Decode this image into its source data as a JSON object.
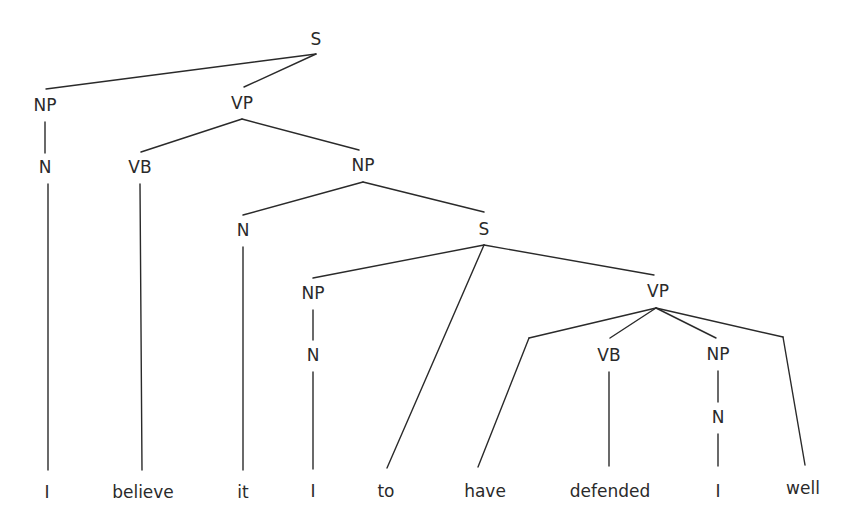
{
  "diagram": {
    "type": "parse-tree",
    "sentence": [
      "I",
      "believe",
      "it",
      "I",
      "to",
      "have",
      "defended",
      "I",
      "well"
    ],
    "nodes": [
      {
        "id": "s1",
        "label": "S",
        "x": 316,
        "y": 40,
        "parent": null
      },
      {
        "id": "np1",
        "label": "NP",
        "x": 45,
        "y": 106,
        "parent": "s1"
      },
      {
        "id": "vp1",
        "label": "VP",
        "x": 242,
        "y": 104,
        "parent": "s1"
      },
      {
        "id": "n1",
        "label": "N",
        "x": 45,
        "y": 168,
        "parent": "np1"
      },
      {
        "id": "vb1",
        "label": "VB",
        "x": 140,
        "y": 168,
        "parent": "vp1"
      },
      {
        "id": "np2",
        "label": "NP",
        "x": 363,
        "y": 166,
        "parent": "vp1"
      },
      {
        "id": "n2",
        "label": "N",
        "x": 243,
        "y": 231,
        "parent": "np2"
      },
      {
        "id": "s2",
        "label": "S",
        "x": 484,
        "y": 230,
        "parent": "np2"
      },
      {
        "id": "np3",
        "label": "NP",
        "x": 313,
        "y": 294,
        "parent": "s2"
      },
      {
        "id": "vp2",
        "label": "VP",
        "x": 658,
        "y": 292,
        "parent": "s2"
      },
      {
        "id": "n3",
        "label": "N",
        "x": 313,
        "y": 356,
        "parent": "np3"
      },
      {
        "id": "vb2",
        "label": "VB",
        "x": 609,
        "y": 356,
        "parent": "vp2"
      },
      {
        "id": "np4",
        "label": "NP",
        "x": 718,
        "y": 355,
        "parent": "vp2"
      },
      {
        "id": "n4",
        "label": "N",
        "x": 718,
        "y": 418,
        "parent": "np4"
      }
    ],
    "leaves": [
      {
        "id": "w1",
        "label": "I",
        "x": 47,
        "y": 493,
        "parent": "n1"
      },
      {
        "id": "w2",
        "label": "believe",
        "x": 143,
        "y": 493,
        "parent": "vb1"
      },
      {
        "id": "w3",
        "label": "it",
        "x": 243,
        "y": 493,
        "parent": "n2"
      },
      {
        "id": "w4",
        "label": "I",
        "x": 313,
        "y": 492,
        "parent": "n3"
      },
      {
        "id": "w5",
        "label": "to",
        "x": 386,
        "y": 492,
        "parent": "s2"
      },
      {
        "id": "w6",
        "label": "have",
        "x": 485,
        "y": 492,
        "parent": "vp2"
      },
      {
        "id": "w7",
        "label": "defended",
        "x": 610,
        "y": 492,
        "parent": "vb2"
      },
      {
        "id": "w8",
        "label": "I",
        "x": 718,
        "y": 492,
        "parent": "n4"
      },
      {
        "id": "w9",
        "label": "well",
        "x": 803,
        "y": 489,
        "parent": "vp2"
      }
    ],
    "edges": [
      {
        "from": "s1",
        "to": "np1",
        "x1": 316,
        "y1": 54,
        "x2": 46,
        "y2": 89
      },
      {
        "from": "s1",
        "to": "vp1",
        "x1": 316,
        "y1": 54,
        "x2": 244,
        "y2": 87
      },
      {
        "from": "vp1",
        "to": "vb1",
        "x1": 242,
        "y1": 119,
        "x2": 141,
        "y2": 152
      },
      {
        "from": "vp1",
        "to": "np2",
        "x1": 242,
        "y1": 119,
        "x2": 359,
        "y2": 150
      },
      {
        "from": "np1",
        "to": "n1",
        "x1": 45,
        "y1": 122,
        "x2": 45,
        "y2": 153
      },
      {
        "from": "np2",
        "to": "n2",
        "x1": 363,
        "y1": 182,
        "x2": 243,
        "y2": 215
      },
      {
        "from": "np2",
        "to": "s2",
        "x1": 363,
        "y1": 182,
        "x2": 484,
        "y2": 212
      },
      {
        "from": "s2",
        "to": "np3",
        "x1": 484,
        "y1": 245,
        "x2": 313,
        "y2": 278
      },
      {
        "from": "s2",
        "to": "vp2",
        "x1": 484,
        "y1": 245,
        "x2": 654,
        "y2": 275
      },
      {
        "from": "s2",
        "to": "w5",
        "x1": 484,
        "y1": 245,
        "x2": 387,
        "y2": 468
      },
      {
        "from": "np3",
        "to": "n3",
        "x1": 313,
        "y1": 310,
        "x2": 313,
        "y2": 340
      },
      {
        "from": "vp2",
        "to": "w6",
        "x1": 656,
        "y1": 308,
        "x2": 529,
        "y2": 338
      },
      {
        "from": "w6a",
        "to": "w6",
        "x1": 529,
        "y1": 338,
        "x2": 478,
        "y2": 467
      },
      {
        "from": "vp2",
        "to": "vb2",
        "x1": 656,
        "y1": 308,
        "x2": 610,
        "y2": 338
      },
      {
        "from": "vp2",
        "to": "np4",
        "x1": 656,
        "y1": 308,
        "x2": 716,
        "y2": 338
      },
      {
        "from": "vp2",
        "to": "w9",
        "x1": 656,
        "y1": 308,
        "x2": 783,
        "y2": 337
      },
      {
        "from": "w9a",
        "to": "w9",
        "x1": 783,
        "y1": 337,
        "x2": 805,
        "y2": 465
      },
      {
        "from": "np4",
        "to": "n4",
        "x1": 718,
        "y1": 371,
        "x2": 718,
        "y2": 402
      },
      {
        "from": "n1",
        "to": "w1",
        "x1": 48,
        "y1": 184,
        "x2": 48,
        "y2": 470
      },
      {
        "from": "vb1",
        "to": "w2",
        "x1": 140,
        "y1": 184,
        "x2": 142,
        "y2": 470
      },
      {
        "from": "n2",
        "to": "w3",
        "x1": 243,
        "y1": 247,
        "x2": 243,
        "y2": 470
      },
      {
        "from": "n3",
        "to": "w4",
        "x1": 313,
        "y1": 372,
        "x2": 313,
        "y2": 469
      },
      {
        "from": "vb2",
        "to": "w7",
        "x1": 609,
        "y1": 372,
        "x2": 609,
        "y2": 466
      },
      {
        "from": "n4",
        "to": "w8",
        "x1": 718,
        "y1": 434,
        "x2": 718,
        "y2": 466
      }
    ]
  }
}
